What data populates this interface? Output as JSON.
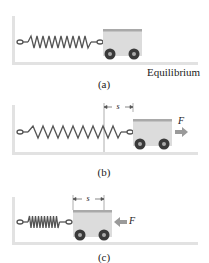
{
  "figure": {
    "panels": [
      {
        "id": "a",
        "caption": "(a)",
        "state_label": "Equilibrium",
        "spring_state": "relaxed",
        "displacement_label": null,
        "force_label": null
      },
      {
        "id": "b",
        "caption": "(b)",
        "spring_state": "stretched",
        "displacement_label": "s",
        "force_label": "F",
        "force_direction": "right"
      },
      {
        "id": "c",
        "caption": "(c)",
        "spring_state": "compressed",
        "displacement_label": "s",
        "force_label": "F",
        "force_direction": "left"
      }
    ],
    "colors": {
      "wall_floor": "#e2e2e2",
      "cart_body": "#dcdcdc",
      "cart_rim": "#a9a9a9",
      "wheel": "#3a3a3a",
      "spring": "#555555",
      "force_arrow": "#9a9a9a",
      "text": "#222222"
    }
  }
}
